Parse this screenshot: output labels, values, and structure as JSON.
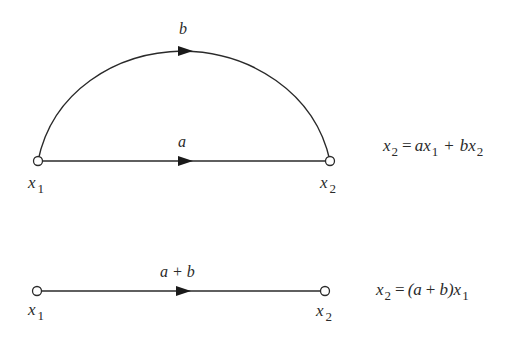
{
  "colors": {
    "ink": "#2a2a2a",
    "background": "#ffffff"
  },
  "top_graph": {
    "nodes": [
      {
        "id": "x1",
        "label": "x",
        "subscript": "1"
      },
      {
        "id": "x2",
        "label": "x",
        "subscript": "2"
      }
    ],
    "edges": [
      {
        "from": "x1",
        "to": "x2",
        "gain": "b",
        "shape": "arc"
      },
      {
        "from": "x1",
        "to": "x2",
        "gain": "a",
        "shape": "straight"
      }
    ],
    "equation": {
      "lhs": "x",
      "lhs_sub": "2",
      "equals": "=",
      "t1_coef": "a",
      "t1_var": "x",
      "t1_sub": "1",
      "plus": "+",
      "t2_coef": "b",
      "t2_var": "x",
      "t2_sub": "2"
    }
  },
  "bottom_graph": {
    "nodes": [
      {
        "id": "x1",
        "label": "x",
        "subscript": "1"
      },
      {
        "id": "x2",
        "label": "x",
        "subscript": "2"
      }
    ],
    "edges": [
      {
        "from": "x1",
        "to": "x2",
        "gain": "a + b",
        "shape": "straight"
      }
    ],
    "equation": {
      "lhs": "x",
      "lhs_sub": "2",
      "equals": "=",
      "open": "(",
      "a": "a",
      "plus": "+",
      "b": "b",
      "close": ")",
      "var": "x",
      "var_sub": "1"
    }
  }
}
